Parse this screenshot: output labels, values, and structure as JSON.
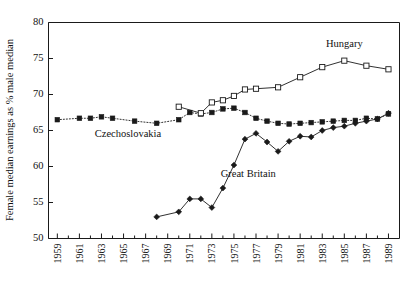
{
  "chart_data": {
    "type": "line",
    "title": "",
    "subtitle": "",
    "xlabel": "",
    "ylabel": "Female median earnings as % male median",
    "xlim": [
      1958.2,
      1990.0
    ],
    "ylim": [
      50,
      80
    ],
    "grid": false,
    "legend_position": "inline-annotations",
    "y_ticks": [
      50,
      55,
      60,
      65,
      70,
      75,
      80
    ],
    "y_tick_labels": [
      "50",
      "55",
      "60",
      "65",
      "70",
      "75",
      "80"
    ],
    "x_ticks": [
      1959,
      1961,
      1963,
      1965,
      1967,
      1969,
      1971,
      1973,
      1975,
      1977,
      1979,
      1981,
      1983,
      1985,
      1987,
      1989
    ],
    "x_tick_labels": [
      "1959",
      "1961",
      "1963",
      "1965",
      "1967",
      "1969",
      "1971",
      "1973",
      "1975",
      "1977",
      "1979",
      "1981",
      "1983",
      "1985",
      "1987",
      "1989"
    ],
    "x_minor_ticks": [
      1960,
      1962,
      1964,
      1966,
      1968,
      1970,
      1972,
      1974,
      1976,
      1978,
      1980,
      1982,
      1984,
      1986,
      1988
    ],
    "series": [
      {
        "name": "Czechoslovakia",
        "marker": "filled-square",
        "linestyle": "dotted",
        "annotation": "Czechoslovakia",
        "annotation_x": 1965.4,
        "annotation_y": 64.1,
        "x": [
          1959,
          1961,
          1962,
          1963,
          1964,
          1966,
          1968,
          1970,
          1971,
          1972,
          1973,
          1974,
          1975,
          1976,
          1977,
          1978,
          1979,
          1980,
          1981,
          1982,
          1983,
          1984,
          1985,
          1986,
          1987,
          1988,
          1989
        ],
        "y": [
          66.5,
          66.7,
          66.7,
          66.9,
          66.7,
          66.3,
          66.0,
          66.5,
          67.5,
          67.3,
          67.5,
          68.0,
          68.1,
          67.5,
          66.7,
          66.3,
          66.0,
          65.9,
          66.0,
          66.1,
          66.2,
          66.3,
          66.4,
          66.4,
          66.7,
          66.6,
          67.3
        ]
      },
      {
        "name": "Hungary",
        "marker": "open-square",
        "linestyle": "solid",
        "annotation": "Hungary",
        "annotation_x": 1985.0,
        "annotation_y": 76.6,
        "x": [
          1970,
          1972,
          1973,
          1974,
          1975,
          1976,
          1977,
          1979,
          1981,
          1983,
          1985,
          1987,
          1989
        ],
        "y": [
          68.3,
          67.4,
          68.9,
          69.2,
          69.8,
          70.7,
          70.8,
          71.0,
          72.4,
          73.8,
          74.7,
          74.0,
          73.5
        ]
      },
      {
        "name": "Great Britain",
        "marker": "filled-diamond",
        "linestyle": "solid",
        "annotation": "Great Britain",
        "annotation_x": 1976.3,
        "annotation_y": 58.6,
        "x": [
          1968,
          1970,
          1971,
          1972,
          1973,
          1974,
          1975,
          1976,
          1977,
          1978,
          1979,
          1980,
          1981,
          1982,
          1983,
          1984,
          1985,
          1986,
          1987,
          1988,
          1989
        ],
        "y": [
          53.0,
          53.7,
          55.5,
          55.5,
          54.3,
          57.0,
          60.2,
          63.8,
          64.6,
          63.4,
          62.1,
          63.5,
          64.2,
          64.1,
          65.0,
          65.4,
          65.6,
          66.0,
          66.3,
          66.6,
          67.4
        ]
      }
    ]
  },
  "colors": {
    "ink": "#1a1a1a",
    "background": "#ffffff",
    "marker_fill": "#1a1a1a",
    "marker_open_fill": "#ffffff"
  }
}
